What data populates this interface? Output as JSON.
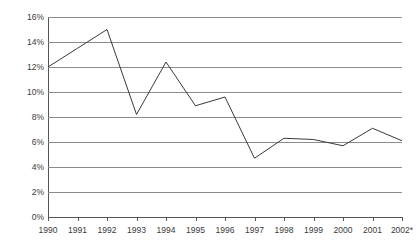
{
  "chart_data": {
    "type": "line",
    "title": "",
    "subtitle": "",
    "xlabel": "",
    "ylabel": "",
    "categories": [
      "1990",
      "1991",
      "1992",
      "1993",
      "1994",
      "1995",
      "1996",
      "1997",
      "1998",
      "1999",
      "2000",
      "2001",
      "2002*"
    ],
    "series": [
      {
        "name": "",
        "values": [
          12.0,
          13.5,
          15.0,
          8.2,
          12.4,
          8.9,
          9.6,
          4.7,
          6.3,
          6.2,
          5.7,
          7.1,
          6.1
        ]
      }
    ],
    "ylim": [
      0,
      16
    ],
    "ytick_labels": [
      "16%",
      "14%",
      "12%",
      "10%",
      "8%",
      "6%",
      "4%",
      "2%",
      "0%"
    ],
    "ytick_values": [
      16,
      14,
      12,
      10,
      8,
      6,
      4,
      2,
      0
    ],
    "grid": "horizontal",
    "legend": "none",
    "annotations": [],
    "colors": {
      "line": "#3a3a3a",
      "gridline": "#8c8c8c",
      "axis": "#555555",
      "text": "#3a3a3a",
      "background": "#ffffff"
    }
  }
}
